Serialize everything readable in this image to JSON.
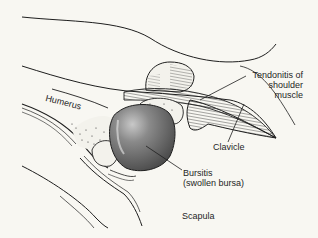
{
  "diagram": {
    "labels": {
      "tendonitis_line1": "Tendonitis of",
      "tendonitis_line2": "shoulder",
      "tendonitis_line3": "muscle",
      "humerus": "Humerus",
      "clavicle": "Clavicle",
      "bursitis_line1": "Bursitis",
      "bursitis_line2": "(swollen bursa)",
      "scapula": "Scapula"
    },
    "colors": {
      "background": "#f8f7f2",
      "ink": "#1e1e1e",
      "bursa_fill": "#6e6e6e",
      "bursa_highlight": "#bdbdbd"
    }
  }
}
